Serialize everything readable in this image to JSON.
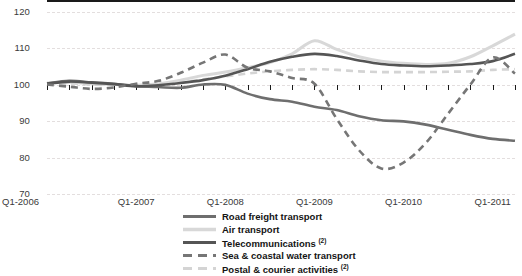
{
  "chart_data": {
    "type": "line",
    "title": "",
    "subtitle": "",
    "xlabel": "",
    "ylabel": "",
    "ylim": [
      70,
      120
    ],
    "yticks": [
      70,
      80,
      90,
      100,
      110,
      120
    ],
    "grid": true,
    "legend_position": "bottom",
    "x_tick_labels": [
      "Q1-2006",
      "Q1-2007",
      "Q1-2008",
      "Q1-2009",
      "Q1-2010",
      "Q1-2011"
    ],
    "x_quarters": [
      "Q1-2006",
      "Q2-2006",
      "Q3-2006",
      "Q4-2006",
      "Q1-2007",
      "Q2-2007",
      "Q3-2007",
      "Q4-2007",
      "Q1-2008",
      "Q2-2008",
      "Q3-2008",
      "Q4-2008",
      "Q1-2009",
      "Q2-2009",
      "Q3-2009",
      "Q4-2009",
      "Q1-2010",
      "Q2-2010",
      "Q3-2010",
      "Q4-2010",
      "Q1-2011",
      "Q2-2011"
    ],
    "series": [
      {
        "name": "Road freight transport",
        "color": "#6e6e6e",
        "style": "solid",
        "width": 2.6,
        "values": [
          100.3,
          101.0,
          100.6,
          100.2,
          99.6,
          99.3,
          99.1,
          100.0,
          99.9,
          97.5,
          96.0,
          95.3,
          93.9,
          93.0,
          91.3,
          90.2,
          89.9,
          89.0,
          87.6,
          86.2,
          85.1,
          84.6
        ]
      },
      {
        "name": "Air transport",
        "color": "#d8d8d8",
        "style": "solid",
        "width": 3.0,
        "values": [
          100.4,
          100.6,
          100.2,
          100.0,
          99.8,
          100.2,
          101.2,
          102.5,
          103.4,
          104.6,
          106.0,
          108.4,
          112.0,
          109.6,
          107.6,
          106.4,
          105.8,
          105.5,
          105.8,
          107.6,
          110.6,
          113.8
        ]
      },
      {
        "name": "Telecommunications",
        "footnote": "2",
        "color": "#555555",
        "style": "solid",
        "width": 2.6,
        "values": [
          100.2,
          100.8,
          100.5,
          100.1,
          99.5,
          99.8,
          100.4,
          101.2,
          102.4,
          104.2,
          106.2,
          107.6,
          108.4,
          107.8,
          106.6,
          105.6,
          105.2,
          105.0,
          105.2,
          105.6,
          106.4,
          108.4
        ]
      },
      {
        "name": "Sea & coastal water transport",
        "footnote": "",
        "color": "#767676",
        "style": "dashed",
        "width": 2.6,
        "values": [
          100.0,
          99.4,
          98.8,
          99.2,
          100.2,
          101.0,
          103.2,
          106.0,
          108.2,
          104.6,
          103.6,
          101.8,
          100.2,
          90.6,
          82.0,
          77.0,
          78.6,
          84.0,
          92.0,
          100.0,
          107.4,
          103.0
        ]
      },
      {
        "name": "Postal & courier activities",
        "footnote": "2",
        "color": "#d4d4d4",
        "style": "dashed",
        "width": 2.6,
        "values": [
          100.2,
          100.3,
          100.0,
          99.8,
          99.6,
          100.0,
          100.6,
          101.4,
          102.2,
          103.0,
          103.6,
          104.0,
          104.2,
          104.0,
          103.6,
          103.4,
          103.4,
          103.4,
          103.5,
          103.6,
          104.0,
          104.2
        ]
      }
    ]
  },
  "legend": {
    "items": [
      {
        "label": "Road freight transport",
        "footnote": ""
      },
      {
        "label": "Air transport",
        "footnote": ""
      },
      {
        "label": "Telecommunications ",
        "footnote": "2"
      },
      {
        "label": "Sea & coastal water transport",
        "footnote": ""
      },
      {
        "label": "Postal & courier activities ",
        "footnote": "2"
      }
    ]
  }
}
